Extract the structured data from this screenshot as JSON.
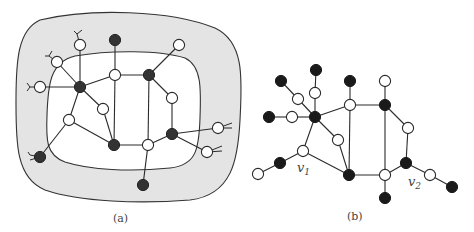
{
  "figure": {
    "panels": [
      {
        "id": "a",
        "caption": "(a)",
        "colors": {
          "annulus_fill": "#e4e4e4",
          "inner_fill": "#ffffff",
          "boundary": "#333333"
        },
        "nodes": [
          {
            "id": "a1",
            "x": 80,
            "y": 45,
            "type": "open"
          },
          {
            "id": "a2",
            "x": 57,
            "y": 62,
            "type": "open"
          },
          {
            "id": "a3",
            "x": 40,
            "y": 87,
            "type": "open"
          },
          {
            "id": "a4",
            "x": 80,
            "y": 87,
            "type": "filled"
          },
          {
            "id": "a5",
            "x": 115,
            "y": 40,
            "type": "filled"
          },
          {
            "id": "a6",
            "x": 115,
            "y": 75,
            "type": "open"
          },
          {
            "id": "a7",
            "x": 149,
            "y": 75,
            "type": "filled"
          },
          {
            "id": "a8",
            "x": 179,
            "y": 45,
            "type": "open"
          },
          {
            "id": "a9",
            "x": 172,
            "y": 98,
            "type": "open"
          },
          {
            "id": "a10",
            "x": 103,
            "y": 109,
            "type": "open"
          },
          {
            "id": "a11",
            "x": 69,
            "y": 120,
            "type": "open"
          },
          {
            "id": "a12",
            "x": 114,
            "y": 145,
            "type": "filled"
          },
          {
            "id": "a13",
            "x": 148,
            "y": 145,
            "type": "open"
          },
          {
            "id": "a14",
            "x": 172,
            "y": 134,
            "type": "filled"
          },
          {
            "id": "a15",
            "x": 218,
            "y": 128,
            "type": "open"
          },
          {
            "id": "a16",
            "x": 207,
            "y": 152,
            "type": "open"
          },
          {
            "id": "a17",
            "x": 40,
            "y": 157,
            "type": "filled"
          },
          {
            "id": "a18",
            "x": 143,
            "y": 185,
            "type": "filled"
          }
        ],
        "edges": [
          [
            "a1",
            "a4"
          ],
          [
            "a2",
            "a4"
          ],
          [
            "a3",
            "a4"
          ],
          [
            "a4",
            "a6"
          ],
          [
            "a4",
            "a10"
          ],
          [
            "a4",
            "a11"
          ],
          [
            "a5",
            "a6"
          ],
          [
            "a6",
            "a7"
          ],
          [
            "a6",
            "a12"
          ],
          [
            "a7",
            "a8"
          ],
          [
            "a7",
            "a9"
          ],
          [
            "a7",
            "a13"
          ],
          [
            "a9",
            "a14"
          ],
          [
            "a10",
            "a12"
          ],
          [
            "a11",
            "a12"
          ],
          [
            "a11",
            "a17"
          ],
          [
            "a12",
            "a13"
          ],
          [
            "a13",
            "a14"
          ],
          [
            "a13",
            "a18"
          ],
          [
            "a14",
            "a15"
          ],
          [
            "a14",
            "a16"
          ]
        ]
      },
      {
        "id": "b",
        "caption": "(b)",
        "labels": [
          {
            "text": "v",
            "sub": "1",
            "x": 297,
            "y": 172
          },
          {
            "text": "v",
            "sub": "2",
            "x": 408,
            "y": 186
          }
        ],
        "nodes": [
          {
            "id": "b1",
            "x": 316,
            "y": 70,
            "type": "filled"
          },
          {
            "id": "b2",
            "x": 281,
            "y": 81,
            "type": "filled"
          },
          {
            "id": "b3",
            "x": 298,
            "y": 99,
            "type": "open"
          },
          {
            "id": "b4",
            "x": 315,
            "y": 93,
            "type": "open"
          },
          {
            "id": "b5",
            "x": 269,
            "y": 117,
            "type": "filled"
          },
          {
            "id": "b6",
            "x": 292,
            "y": 117,
            "type": "open"
          },
          {
            "id": "b7",
            "x": 315,
            "y": 117,
            "type": "filled"
          },
          {
            "id": "b8",
            "x": 350,
            "y": 81,
            "type": "filled"
          },
          {
            "id": "b9",
            "x": 350,
            "y": 105,
            "type": "open"
          },
          {
            "id": "b10",
            "x": 385,
            "y": 81,
            "type": "open"
          },
          {
            "id": "b11",
            "x": 385,
            "y": 105,
            "type": "filled"
          },
          {
            "id": "b12",
            "x": 408,
            "y": 128,
            "type": "open"
          },
          {
            "id": "b13",
            "x": 338,
            "y": 140,
            "type": "open"
          },
          {
            "id": "b14",
            "x": 303,
            "y": 151,
            "type": "open"
          },
          {
            "id": "b15",
            "x": 280,
            "y": 163,
            "type": "filled"
          },
          {
            "id": "b16",
            "x": 258,
            "y": 174,
            "type": "open"
          },
          {
            "id": "b17",
            "x": 349,
            "y": 175,
            "type": "filled"
          },
          {
            "id": "b18",
            "x": 385,
            "y": 175,
            "type": "open"
          },
          {
            "id": "b19",
            "x": 406,
            "y": 163,
            "type": "filled"
          },
          {
            "id": "b20",
            "x": 430,
            "y": 175,
            "type": "open"
          },
          {
            "id": "b21",
            "x": 452,
            "y": 187,
            "type": "filled"
          },
          {
            "id": "b22",
            "x": 385,
            "y": 198,
            "type": "filled"
          }
        ],
        "edges": [
          [
            "b1",
            "b4"
          ],
          [
            "b4",
            "b7"
          ],
          [
            "b2",
            "b3"
          ],
          [
            "b3",
            "b7"
          ],
          [
            "b5",
            "b6"
          ],
          [
            "b6",
            "b7"
          ],
          [
            "b7",
            "b9"
          ],
          [
            "b7",
            "b13"
          ],
          [
            "b7",
            "b14"
          ],
          [
            "b8",
            "b9"
          ],
          [
            "b9",
            "b11"
          ],
          [
            "b9",
            "b17"
          ],
          [
            "b10",
            "b11"
          ],
          [
            "b11",
            "b12"
          ],
          [
            "b11",
            "b18"
          ],
          [
            "b12",
            "b19"
          ],
          [
            "b13",
            "b17"
          ],
          [
            "b14",
            "b17"
          ],
          [
            "b14",
            "b15"
          ],
          [
            "b15",
            "b16"
          ],
          [
            "b17",
            "b18"
          ],
          [
            "b18",
            "b19"
          ],
          [
            "b18",
            "b22"
          ],
          [
            "b19",
            "b20"
          ],
          [
            "b20",
            "b21"
          ]
        ]
      }
    ]
  }
}
